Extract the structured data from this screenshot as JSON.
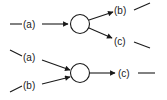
{
  "diagram": {
    "top": {
      "description": "split: one input (a) into two outputs (b) and (c)",
      "inputs": [
        {
          "label": "(a)"
        }
      ],
      "outputs": [
        {
          "label": "(b)"
        },
        {
          "label": "(c)"
        }
      ]
    },
    "bottom": {
      "description": "merge: two inputs (a) and (b) into one output (c)",
      "inputs": [
        {
          "label": "(a)"
        },
        {
          "label": "(b)"
        }
      ],
      "outputs": [
        {
          "label": "(c)"
        }
      ]
    },
    "colors": {
      "stroke": "#1a1a1a",
      "background": "#ffffff"
    }
  }
}
